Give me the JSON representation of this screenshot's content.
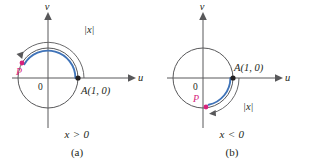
{
  "figure": {
    "type": "unit-circle-wrapping-diagram",
    "colors": {
      "arc_highlight": "#3f73b8",
      "point_p": "#d6227c",
      "point_a": "#231f20",
      "axis": "#58585a",
      "background": "#ffffff"
    }
  },
  "panels": [
    {
      "id": "a",
      "caption_condition": "x > 0",
      "caption_name": "(a)",
      "axis_u_label": "u",
      "axis_v_label": "v",
      "origin_label": "0",
      "point_a_label": "A(1, 0)",
      "point_p_label": "P",
      "arc_length_label": "|x|",
      "direction": "counterclockwise",
      "arc_start_deg": 0,
      "arc_end_deg": 150
    },
    {
      "id": "b",
      "caption_condition": "x < 0",
      "caption_name": "(b)",
      "axis_u_label": "u",
      "axis_v_label": "v",
      "origin_label": "0",
      "point_a_label": "A(1, 0)",
      "point_p_label": "P",
      "arc_length_label": "|x|",
      "direction": "clockwise",
      "arc_start_deg": 0,
      "arc_end_deg": -78
    }
  ]
}
